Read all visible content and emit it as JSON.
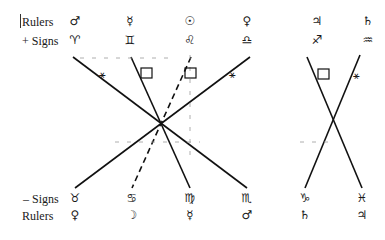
{
  "top": {
    "rulers_label": "Rulers",
    "signs_label": "+ Signs",
    "rulers": [
      "♂",
      "☿",
      "☉",
      "♀",
      "♃",
      "♄"
    ],
    "signs": [
      "♈",
      "♊",
      "♌",
      "♎",
      "♐",
      "♒"
    ]
  },
  "bottom": {
    "signs_label": "– Signs",
    "rulers_label": "Rulers",
    "signs": [
      "♉",
      "♋",
      "♍",
      "♏",
      "♑",
      "♓"
    ],
    "rulers": [
      "♀",
      "☽",
      "☿",
      "♂",
      "♄",
      "♃"
    ]
  },
  "aspects": {
    "sextile_symbol": "⚹",
    "square_symbol": "□",
    "left_group": [
      {
        "from": "♈",
        "to": "♏",
        "style": "solid",
        "aspect": "sextile"
      },
      {
        "from": "♊",
        "to": "♍",
        "style": "solid",
        "aspect": "square"
      },
      {
        "from": "♌",
        "to": "♋",
        "style": "dashed",
        "aspect": "square"
      },
      {
        "from": "♎",
        "to": "♉",
        "style": "solid",
        "aspect": "sextile"
      }
    ],
    "right_group": [
      {
        "from": "♐",
        "to": "♓",
        "style": "solid",
        "aspect": "square"
      },
      {
        "from": "♒",
        "to": "♑",
        "style": "solid",
        "aspect": "sextile"
      }
    ]
  }
}
